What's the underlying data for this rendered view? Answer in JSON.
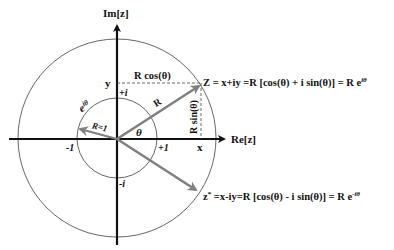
{
  "diagram": {
    "axes": {
      "imag_label": "Im[z]",
      "real_label": "Re[z]"
    },
    "unit_circle": {
      "radius_label": "R=1",
      "arc_label": "e",
      "arc_label_sup": "iθ",
      "ticks": {
        "plus_i": "+i",
        "minus_i": "-i",
        "plus_one": "+1",
        "minus_one": "-1"
      }
    },
    "vector_z": {
      "radius_label": "R",
      "angle_label": "θ",
      "x_label": "x",
      "y_label": "y",
      "cos_label": "R cos(θ)",
      "sin_label": "R sin(θ)",
      "equation": "Z = x+iy =R [cos(θ) + i sin(θ)] = R e",
      "equation_sup": "iθ"
    },
    "vector_conjugate": {
      "equation_prefix": "z",
      "equation_star": "*",
      "equation": " =x-iy=R [cos(θ) - i sin(θ)]  = R e",
      "equation_sup": "-iθ"
    },
    "colors": {
      "axis": "#111111",
      "vector": "#808080",
      "circle": "#555555"
    }
  }
}
